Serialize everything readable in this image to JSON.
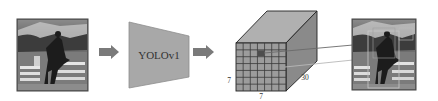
{
  "diagram": {
    "input_image": {
      "name": "input-image",
      "description": "horse jumping photo"
    },
    "model": {
      "label": "YOLOv1"
    },
    "output_tensor": {
      "grid_rows": 7,
      "grid_cols": 7,
      "depth": 30,
      "height_label": "7",
      "width_label": "7",
      "depth_label": "30",
      "highlighted_cell": {
        "row": 1,
        "col": 3
      }
    },
    "output_image": {
      "name": "detection-image",
      "description": "horse jumping photo with bounding boxes"
    },
    "arrows": [
      "input-to-model",
      "model-to-tensor"
    ],
    "colors": {
      "arrow": "#7a7a7a",
      "model_fill": "#a8a8a8",
      "cube_front": "#9c9c9c",
      "cube_top": "#b0b0b0",
      "cube_side": "#8a8a8a",
      "grid_line": "#3a3a3a",
      "highlight_cell": "#4d4d4d",
      "edge": "#222222",
      "connector_dark": "#6a6a6a",
      "connector_light": "#b8b8b8"
    }
  }
}
